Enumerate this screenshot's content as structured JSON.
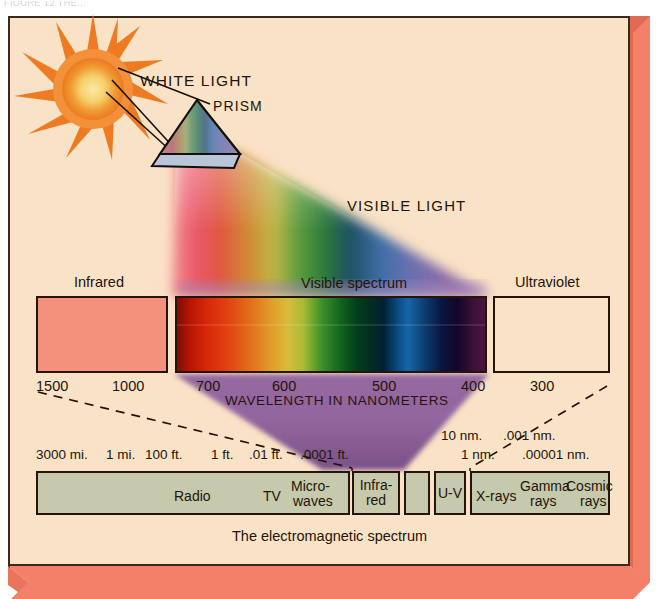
{
  "header": {
    "cropped_text": "FIGURE 12   THE..."
  },
  "figure": {
    "caption": "The electromagnetic spectrum",
    "labels": {
      "white_light": "WHITE LIGHT",
      "prism": "PRISM",
      "visible_light": "VISIBLE LIGHT",
      "wavelength_axis": "WAVELENGTH IN NANOMETERS"
    },
    "swatches": [
      {
        "name": "infrared",
        "label": "Infrared",
        "color": "#f4917c"
      },
      {
        "name": "visible-spectrum",
        "label": "Visible spectrum",
        "color": "spectrum"
      },
      {
        "name": "ultraviolet",
        "label": "Ultraviolet",
        "color": "#fae2c6"
      }
    ]
  },
  "chart_data": {
    "type": "bar",
    "title": "The electromagnetic spectrum",
    "xlabel": "WAVELENGTH IN NANOMETERS",
    "ylabel": "",
    "grid": false,
    "legend_position": "none",
    "wavelength_scale": {
      "unit": "nanometers",
      "tick_labels": [
        "1500",
        "1000",
        "700",
        "600",
        "500",
        "400",
        "300"
      ],
      "values": [
        1500,
        1000,
        700,
        600,
        500,
        400,
        300
      ],
      "direction": "decreasing-left-to-right"
    },
    "visible_spectrum_colors": [
      {
        "name": "red",
        "nm_range": [
          700,
          620
        ],
        "hex": "#d8290a"
      },
      {
        "name": "orange",
        "nm_range": [
          620,
          590
        ],
        "hex": "#e2691a"
      },
      {
        "name": "yellow",
        "nm_range": [
          590,
          570
        ],
        "hex": "#d7bc3a"
      },
      {
        "name": "green",
        "nm_range": [
          570,
          495
        ],
        "hex": "#12651f"
      },
      {
        "name": "blue",
        "nm_range": [
          495,
          450
        ],
        "hex": "#1666a8"
      },
      {
        "name": "indigo",
        "nm_range": [
          450,
          425
        ],
        "hex": "#08153f"
      },
      {
        "name": "violet",
        "nm_range": [
          425,
          400
        ],
        "hex": "#4a1540"
      }
    ],
    "em_scale_top_labels": [
      "3000 mi.",
      "1 mi.",
      "100 ft.",
      "1 ft.",
      ".01 ft.",
      ".0001 ft.",
      "10 nm.",
      ".001 nm.",
      "1 nm.",
      ".00001 nm."
    ],
    "categories": [
      "Radio",
      "TV",
      "Micro-waves",
      "Infra-red",
      "Visible",
      "U-V",
      "X-rays",
      "Gamma rays",
      "Cosmic rays"
    ],
    "bands": [
      {
        "name": "radio",
        "label": "Radio",
        "x": 36,
        "w": 314
      },
      {
        "name": "tv",
        "label": "TV",
        "x": 36,
        "w": 314
      },
      {
        "name": "microwaves",
        "label": "Micro-\nwaves",
        "x": 36,
        "w": 314
      },
      {
        "name": "infrared",
        "label": "Infra-\nred",
        "x": 352,
        "w": 48
      },
      {
        "name": "visible",
        "label": "",
        "x": 404,
        "w": 26
      },
      {
        "name": "ultraviolet",
        "label": "U-V",
        "x": 434,
        "w": 32
      },
      {
        "name": "xrays-plus",
        "label": "X-rays  Gamma rays  Cosmic rays",
        "x": 470,
        "w": 140
      }
    ]
  },
  "em_bar": {
    "box1_labels": [
      {
        "text": "Radio",
        "left": 136,
        "top": 16
      },
      {
        "text": "TV",
        "left": 225,
        "top": 16
      },
      {
        "text": "Micro-",
        "left": 253,
        "top": 6
      },
      {
        "text": "waves",
        "left": 255,
        "top": 21
      }
    ],
    "box_infrared": {
      "line1": "Infra-",
      "line2": "red"
    },
    "box_uv": {
      "text": "U-V"
    },
    "box_hard": [
      {
        "text": "X-rays",
        "left": 4,
        "top": 16
      },
      {
        "text": "Gamma",
        "left": 48,
        "top": 6
      },
      {
        "text": "rays",
        "left": 58,
        "top": 21
      },
      {
        "text": "Cosmic",
        "left": 94,
        "top": 6
      },
      {
        "text": "rays",
        "left": 108,
        "top": 21
      }
    ],
    "top_scale": [
      {
        "text": "3000 mi.",
        "left": 36,
        "top": 447
      },
      {
        "text": "1 mi.",
        "left": 106,
        "top": 447
      },
      {
        "text": "100 ft.",
        "left": 145,
        "top": 447
      },
      {
        "text": "1 ft.",
        "left": 211,
        "top": 447
      },
      {
        "text": ".01 ft.",
        "left": 249,
        "top": 447
      },
      {
        "text": ".0001 ft.",
        "left": 300,
        "top": 447
      },
      {
        "text": "10 nm.",
        "left": 441,
        "top": 428
      },
      {
        "text": ".001 nm.",
        "left": 503,
        "top": 428
      },
      {
        "text": "1 nm.",
        "left": 461,
        "top": 447
      },
      {
        "text": ".00001 nm.",
        "left": 522,
        "top": 447
      }
    ]
  },
  "ticks": [
    {
      "text": "1500",
      "left": 36
    },
    {
      "text": "1000",
      "left": 112
    },
    {
      "text": "700",
      "left": 196
    },
    {
      "text": "600",
      "left": 272
    },
    {
      "text": "500",
      "left": 372
    },
    {
      "text": "400",
      "left": 461
    },
    {
      "text": "300",
      "left": 530
    }
  ],
  "colors": {
    "panel_bg": "#fae2c6",
    "frame_coral": "#f4806a",
    "frame_coral_dark": "#e06a52",
    "ink": "#241508",
    "band_fill": "#c6c9ac",
    "infrared_swatch": "#f4917c",
    "sun_core": "#f7d77a",
    "sun_ray": "#f07a22"
  }
}
